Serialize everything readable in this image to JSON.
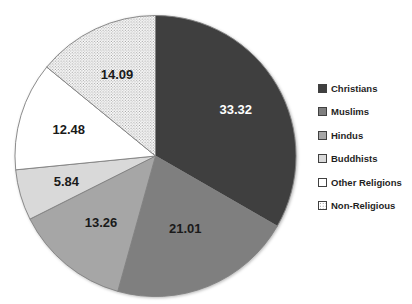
{
  "chart_data": {
    "type": "pie",
    "title": "",
    "legend_position": "right",
    "start_angle_deg": 0,
    "direction": "clockwise",
    "total": 100.0,
    "slices": [
      {
        "label": "Christians",
        "value": 33.32,
        "display": "33.32",
        "color": "#3f3f3f",
        "pattern": "solid",
        "label_color": "#ffffff"
      },
      {
        "label": "Muslims",
        "value": 21.01,
        "display": "21.01",
        "color": "#7f7f7f",
        "pattern": "solid",
        "label_color": "#1a1a1a"
      },
      {
        "label": "Hindus",
        "value": 13.26,
        "display": "13.26",
        "color": "#a6a6a6",
        "pattern": "solid",
        "label_color": "#1a1a1a"
      },
      {
        "label": "Buddhists",
        "value": 5.84,
        "display": "5.84",
        "color": "#d9d9d9",
        "pattern": "solid",
        "label_color": "#1a1a1a"
      },
      {
        "label": "Other Religions",
        "value": 12.48,
        "display": "12.48",
        "color": "#ffffff",
        "pattern": "solid",
        "label_color": "#1a1a1a"
      },
      {
        "label": "Non-Religious",
        "value": 14.09,
        "display": "14.09",
        "color": "#ffffff",
        "pattern": "dots",
        "label_color": "#1a1a1a"
      }
    ],
    "stroke_color": "#808080",
    "dot_color": "#8c8c8c",
    "swatch_border_color": "#404040",
    "background_color": "#ffffff"
  }
}
